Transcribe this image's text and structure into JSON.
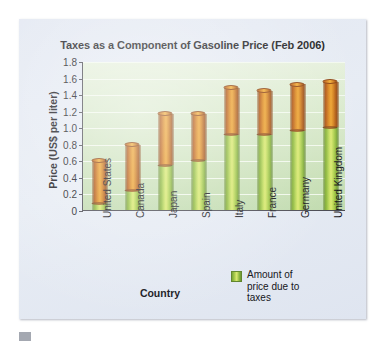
{
  "figure": {
    "title": "Taxes as a Component of Gasoline Price (Feb 2006)",
    "panel_background": "#e4e9f3",
    "caption_marker": "caption-bar-marker",
    "caption_text": ""
  },
  "legend": {
    "label": "Amount of price due to taxes",
    "swatch_color": "#a8cc47",
    "position": "inside-bottom-right"
  },
  "colors": {
    "tax_green": "#a8cc47",
    "base_orange": "#dd8a1e",
    "plot_background": "#d6e8c6",
    "gridline": "#f4faf0",
    "axis": "#4a4a52",
    "text": "#15151a"
  },
  "chart_data": {
    "type": "bar",
    "subtype": "stacked-vertical-cylinder",
    "title": "Taxes as a Component of Gasoline Price (Feb 2006)",
    "xlabel": "Country",
    "ylabel": "Price (US$ per liter)",
    "ylim": [
      0,
      1.8
    ],
    "ytick_labels": [
      "0",
      "0.2",
      "0.4",
      "0.6",
      "0.8",
      "1.0",
      "1.2",
      "1.4",
      "1.6",
      "1.8"
    ],
    "ytick_values": [
      0,
      0.2,
      0.4,
      0.6,
      0.8,
      1.0,
      1.2,
      1.4,
      1.6,
      1.8
    ],
    "grid": true,
    "grid_axis": "y",
    "legend_position": "inside bottom-right",
    "categories": [
      "United States",
      "Canada",
      "Japan",
      "Spain",
      "Italy",
      "France",
      "Germany",
      "United Kingdom"
    ],
    "series": [
      {
        "name": "Amount of price due to taxes",
        "color": "#a8cc47",
        "values": [
          0.08,
          0.23,
          0.54,
          0.6,
          0.91,
          0.91,
          0.96,
          1.0
        ]
      },
      {
        "name": "Remainder of price",
        "color": "#dd8a1e",
        "values": [
          0.52,
          0.56,
          0.62,
          0.56,
          0.57,
          0.53,
          0.56,
          0.55
        ]
      }
    ],
    "totals": [
      0.6,
      0.79,
      1.16,
      1.16,
      1.48,
      1.44,
      1.52,
      1.55
    ]
  }
}
